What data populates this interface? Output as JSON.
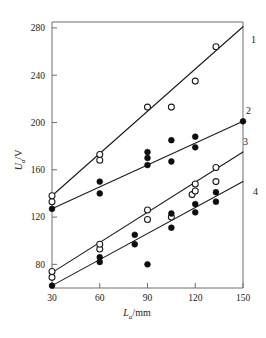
{
  "chart_data": {
    "type": "scatter",
    "title": "",
    "xlabel": "L_a/mm",
    "ylabel": "U_a/V",
    "xlabel_base": "L",
    "xlabel_sub": "a",
    "xlabel_unit": "/mm",
    "ylabel_base": "U",
    "ylabel_sub": "a",
    "ylabel_unit": "/V",
    "xlim": [
      30,
      150
    ],
    "ylim": [
      60,
      285
    ],
    "xticks": [
      30,
      60,
      90,
      120,
      150
    ],
    "yticks": [
      80,
      120,
      160,
      200,
      240,
      280
    ],
    "grid": false,
    "legend": "curve-end-labels",
    "series": [
      {
        "name": "1",
        "label": "1",
        "marker": "open-circle",
        "fit_line": {
          "x": [
            30,
            150
          ],
          "y": [
            138,
            281
          ]
        },
        "points": [
          {
            "x": 30,
            "y": 133
          },
          {
            "x": 30,
            "y": 138
          },
          {
            "x": 60,
            "y": 168
          },
          {
            "x": 60,
            "y": 173
          },
          {
            "x": 90,
            "y": 213
          },
          {
            "x": 105,
            "y": 213
          },
          {
            "x": 120,
            "y": 235
          },
          {
            "x": 133,
            "y": 264
          }
        ]
      },
      {
        "name": "2",
        "label": "2",
        "marker": "filled-circle",
        "fit_line": {
          "x": [
            30,
            150
          ],
          "y": [
            127,
            201
          ]
        },
        "points": [
          {
            "x": 30,
            "y": 127
          },
          {
            "x": 60,
            "y": 140
          },
          {
            "x": 60,
            "y": 150
          },
          {
            "x": 90,
            "y": 164
          },
          {
            "x": 90,
            "y": 170
          },
          {
            "x": 90,
            "y": 175
          },
          {
            "x": 105,
            "y": 167
          },
          {
            "x": 105,
            "y": 185
          },
          {
            "x": 120,
            "y": 179
          },
          {
            "x": 120,
            "y": 188
          },
          {
            "x": 150,
            "y": 201
          }
        ]
      },
      {
        "name": "3",
        "label": "3",
        "marker": "open-circle",
        "fit_line": {
          "x": [
            30,
            150
          ],
          "y": [
            73,
            175
          ]
        },
        "points": [
          {
            "x": 30,
            "y": 69
          },
          {
            "x": 30,
            "y": 74
          },
          {
            "x": 60,
            "y": 93
          },
          {
            "x": 60,
            "y": 97
          },
          {
            "x": 90,
            "y": 118
          },
          {
            "x": 90,
            "y": 126
          },
          {
            "x": 105,
            "y": 120
          },
          {
            "x": 118,
            "y": 139
          },
          {
            "x": 120,
            "y": 142
          },
          {
            "x": 120,
            "y": 148
          },
          {
            "x": 133,
            "y": 150
          },
          {
            "x": 133,
            "y": 162
          }
        ]
      },
      {
        "name": "4",
        "label": "4",
        "marker": "filled-circle",
        "fit_line": {
          "x": [
            30,
            150
          ],
          "y": [
            62,
            150
          ]
        },
        "points": [
          {
            "x": 30,
            "y": 62
          },
          {
            "x": 60,
            "y": 82
          },
          {
            "x": 60,
            "y": 86
          },
          {
            "x": 82,
            "y": 97
          },
          {
            "x": 82,
            "y": 105
          },
          {
            "x": 90,
            "y": 80
          },
          {
            "x": 105,
            "y": 111
          },
          {
            "x": 105,
            "y": 123
          },
          {
            "x": 120,
            "y": 124
          },
          {
            "x": 120,
            "y": 131
          },
          {
            "x": 133,
            "y": 133
          },
          {
            "x": 133,
            "y": 141
          }
        ]
      }
    ]
  },
  "axis": {
    "x_tick_labels": [
      "30",
      "60",
      "90",
      "120",
      "150"
    ],
    "y_tick_labels": [
      "80",
      "120",
      "160",
      "200",
      "240",
      "280"
    ]
  },
  "curve_labels": [
    "1",
    "2",
    "3",
    "4"
  ]
}
